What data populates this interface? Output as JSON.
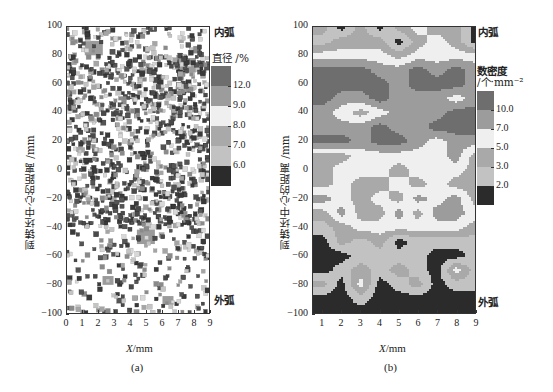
{
  "chart_data": [
    {
      "id": "a",
      "type": "scatter",
      "subplot_label": "(a)",
      "title": "",
      "xlabel": "X/mm",
      "xlabel_var": "X",
      "xlabel_unit": "/mm",
      "ylabel": "到铸坯中心的距离 /mm",
      "xlim": [
        0,
        9
      ],
      "ylim": [
        -100,
        100
      ],
      "xticks": [
        0,
        1,
        2,
        3,
        4,
        5,
        6,
        7,
        8,
        9
      ],
      "yticks": [
        100,
        80,
        60,
        40,
        20,
        0,
        -20,
        -40,
        -60,
        -80,
        -100
      ],
      "annotations": [
        {
          "text": "内弧",
          "position": "top-right",
          "meaning": "inner arc"
        },
        {
          "text": "外弧",
          "position": "bottom-right",
          "meaning": "outer arc"
        }
      ],
      "colorbar": {
        "title": "直径 /%",
        "levels": [
          "12.0",
          "9.0",
          "8.0",
          "7.0",
          "6.0"
        ],
        "bands": [
          "#6e6e6e",
          "#9c9c9c",
          "#efefef",
          "#a9a9a9",
          "#c2c2c2",
          "#2b2b2b"
        ]
      },
      "marker": "square",
      "description": "Square markers representing inclusions; densest between y≈75 and y≈-40 mm, sparse toward -100 mm; a few large clusters near (1.5,85), (7.5,72), (5,-50)",
      "density_profile": [
        {
          "y_range": [
            80,
            100
          ],
          "relative_density": 0.45
        },
        {
          "y_range": [
            40,
            80
          ],
          "relative_density": 1.0
        },
        {
          "y_range": [
            0,
            40
          ],
          "relative_density": 0.85
        },
        {
          "y_range": [
            -40,
            0
          ],
          "relative_density": 0.9
        },
        {
          "y_range": [
            -100,
            -40
          ],
          "relative_density": 0.35
        }
      ],
      "large_clusters": [
        {
          "x": 1.7,
          "y": 84,
          "size": "large"
        },
        {
          "x": 7.6,
          "y": 72,
          "size": "large"
        },
        {
          "x": 5.0,
          "y": -48,
          "size": "large"
        },
        {
          "x": 2.6,
          "y": -78,
          "size": "medium"
        },
        {
          "x": 6.4,
          "y": -92,
          "size": "medium"
        }
      ]
    },
    {
      "id": "b",
      "type": "heatmap",
      "subtype": "filled-contour",
      "subplot_label": "(b)",
      "title": "",
      "xlabel": "X/mm",
      "xlabel_var": "X",
      "xlabel_unit": "/mm",
      "ylabel": "到铸坯中心的距离 /mm",
      "xlim": [
        0.5,
        9
      ],
      "ylim": [
        -100,
        100
      ],
      "xticks": [
        1,
        2,
        3,
        4,
        5,
        6,
        7,
        8,
        9
      ],
      "yticks": [
        100,
        80,
        60,
        40,
        20,
        0,
        -20,
        -40,
        -60,
        -80,
        -100
      ],
      "annotations": [
        {
          "text": "内弧",
          "position": "top-right",
          "meaning": "inner arc"
        },
        {
          "text": "外弧",
          "position": "bottom-right",
          "meaning": "outer arc"
        }
      ],
      "colorbar": {
        "title_line1": "数密度",
        "title_line2": "/个·mm⁻²",
        "levels": [
          "10.0",
          "7.0",
          "5.0",
          "3.0",
          "2.0"
        ],
        "bands": [
          "#6e6e6e",
          "#9c9c9c",
          "#efefef",
          "#a9a9a9",
          "#c2c2c2",
          "#2b2b2b"
        ]
      },
      "x": [
        1,
        2,
        3,
        4,
        5,
        6,
        7,
        8,
        9
      ],
      "y": [
        100,
        90,
        80,
        70,
        60,
        50,
        40,
        30,
        20,
        10,
        0,
        -10,
        -20,
        -30,
        -40,
        -50,
        -60,
        -70,
        -80,
        -90,
        -100
      ],
      "z_level_index_note": "0=>10 (darkest gray), 1=7-10, 2=5-7 (white), 3=3-5, 4=2-3, 5=<2 (black)",
      "z": [
        [
          3,
          5,
          3,
          5,
          3,
          2,
          3,
          3,
          5
        ],
        [
          4,
          3,
          3,
          3,
          5,
          3,
          2,
          3,
          5
        ],
        [
          2,
          2,
          2,
          2,
          3,
          2,
          2,
          2,
          2
        ],
        [
          0,
          0,
          0,
          1,
          1,
          0,
          1,
          0,
          1
        ],
        [
          0,
          0,
          0,
          0,
          1,
          0,
          0,
          0,
          1
        ],
        [
          0,
          1,
          1,
          0,
          1,
          1,
          1,
          2,
          1
        ],
        [
          1,
          2,
          3,
          2,
          1,
          1,
          1,
          0,
          0
        ],
        [
          1,
          1,
          1,
          0,
          1,
          1,
          0,
          0,
          0
        ],
        [
          0,
          0,
          1,
          0,
          0,
          1,
          2,
          1,
          1
        ],
        [
          3,
          3,
          2,
          2,
          2,
          2,
          2,
          1,
          3
        ],
        [
          3,
          2,
          2,
          2,
          3,
          2,
          2,
          2,
          3
        ],
        [
          3,
          2,
          3,
          3,
          2,
          3,
          2,
          3,
          3
        ],
        [
          1,
          2,
          3,
          2,
          3,
          1,
          2,
          1,
          3
        ],
        [
          3,
          1,
          3,
          3,
          1,
          3,
          1,
          1,
          2
        ],
        [
          4,
          3,
          2,
          2,
          2,
          2,
          2,
          2,
          3
        ],
        [
          5,
          3,
          4,
          3,
          5,
          4,
          4,
          4,
          4
        ],
        [
          5,
          5,
          4,
          4,
          4,
          4,
          5,
          5,
          4
        ],
        [
          5,
          4,
          3,
          4,
          3,
          4,
          5,
          2,
          4
        ],
        [
          3,
          5,
          2,
          5,
          4,
          3,
          5,
          4,
          4
        ],
        [
          5,
          5,
          4,
          5,
          5,
          5,
          5,
          5,
          5
        ],
        [
          5,
          5,
          5,
          5,
          5,
          5,
          5,
          5,
          5
        ]
      ]
    }
  ]
}
